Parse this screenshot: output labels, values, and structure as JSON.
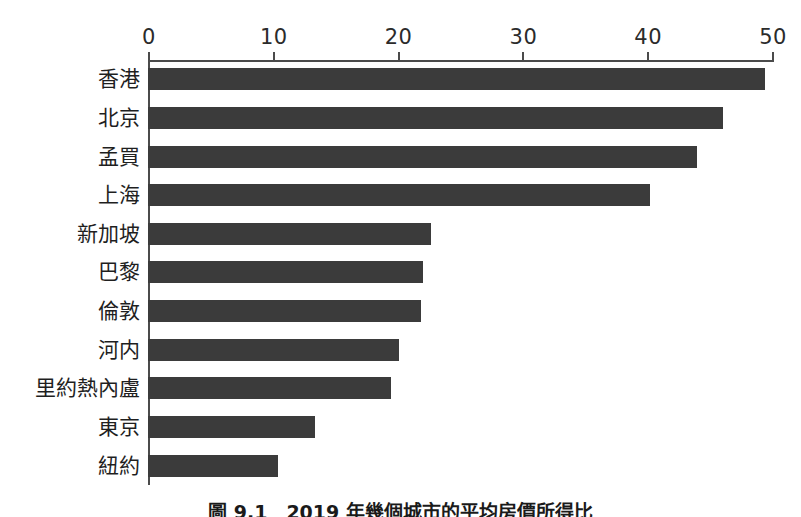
{
  "chart_data": {
    "type": "bar",
    "orientation": "horizontal",
    "title": "",
    "caption": "圖 9.1　2019 年幾個城市的平均房價所得比",
    "xlabel": "",
    "ylabel": "",
    "xlim": [
      0,
      50
    ],
    "xticks": [
      0,
      10,
      20,
      30,
      40,
      50
    ],
    "xtick_labels": [
      "0",
      "10",
      "20",
      "30",
      "40",
      "50"
    ],
    "grid": false,
    "legend": false,
    "bar_color": "#3b3b3b",
    "axis_color": "#4b4b4b",
    "categories": [
      "香港",
      "北京",
      "孟買",
      "上海",
      "新加坡",
      "巴黎",
      "倫敦",
      "河内",
      "里約熱內盧",
      "東京",
      "紐約"
    ],
    "values": [
      49.4,
      46.1,
      44.0,
      40.2,
      22.7,
      22.0,
      21.9,
      20.1,
      19.5,
      13.4,
      10.4
    ]
  }
}
